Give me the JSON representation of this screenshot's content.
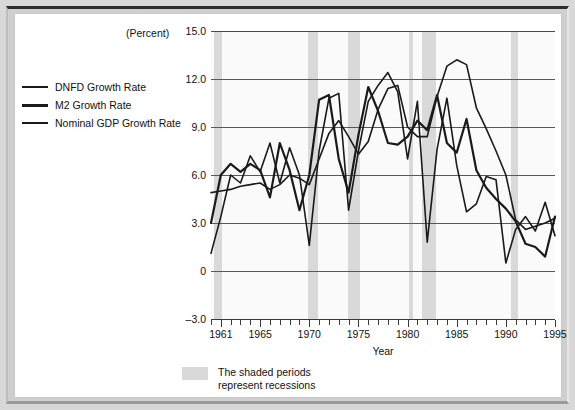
{
  "figure": {
    "unit_label": "(Percent)",
    "x_axis_title": "Year",
    "footnote": [
      "The shaded periods",
      "represent recessions"
    ],
    "shade_color": "#d9d9d9",
    "line_color": "#1a1a1a",
    "plot_bg": "#fafafa"
  },
  "legend": {
    "items": [
      {
        "label": "DNFD Growth Rate",
        "thick": false
      },
      {
        "label": "M2 Growth Rate",
        "thick": true
      },
      {
        "label": "Nominal GDP Growth Rate",
        "thick": false
      }
    ]
  },
  "chart_data": {
    "type": "line",
    "title": "",
    "xlabel": "Year",
    "ylabel": "(Percent)",
    "xlim": [
      1960,
      1995
    ],
    "ylim": [
      -3.0,
      15.0
    ],
    "grid": true,
    "legend_position": "left",
    "ytick_labels": [
      "15.0",
      "12.0",
      "9.0",
      "6.0",
      "3.0",
      "0",
      "-3.0"
    ],
    "ytick_values": [
      15.0,
      12.0,
      9.0,
      6.0,
      3.0,
      0,
      -3.0
    ],
    "xtick_labels": [
      "1961",
      "1965",
      "1970",
      "1975",
      "1980",
      "1985",
      "1990",
      "1995"
    ],
    "xtick_values": [
      1961,
      1965,
      1970,
      1975,
      1980,
      1985,
      1990,
      1995
    ],
    "x": [
      1960,
      1961,
      1962,
      1963,
      1964,
      1965,
      1966,
      1967,
      1968,
      1969,
      1970,
      1971,
      1972,
      1973,
      1974,
      1975,
      1976,
      1977,
      1978,
      1979,
      1980,
      1981,
      1982,
      1983,
      1984,
      1985,
      1986,
      1987,
      1988,
      1989,
      1990,
      1991,
      1992,
      1993,
      1994,
      1995
    ],
    "series": [
      {
        "name": "DNFD Growth Rate",
        "values": [
          4.9,
          5.0,
          5.1,
          5.3,
          5.4,
          5.5,
          5.1,
          5.4,
          6.0,
          5.8,
          5.4,
          7.0,
          8.6,
          9.4,
          8.4,
          7.3,
          8.1,
          10.1,
          11.4,
          11.6,
          9.0,
          8.4,
          8.4,
          10.9,
          12.8,
          13.2,
          12.9,
          10.2,
          8.9,
          7.5,
          6.0,
          3.2,
          2.6,
          2.8,
          3.0,
          3.3
        ]
      },
      {
        "name": "M2 Growth Rate",
        "values": [
          3.0,
          6.0,
          6.7,
          6.2,
          6.7,
          6.3,
          4.6,
          8.0,
          6.3,
          3.8,
          6.0,
          10.7,
          11.0,
          7.0,
          4.9,
          8.5,
          11.5,
          10.0,
          8.0,
          7.9,
          8.4,
          9.4,
          8.8,
          11.0,
          8.0,
          7.4,
          9.5,
          6.3,
          5.2,
          4.5,
          3.9,
          3.1,
          1.7,
          1.5,
          0.9,
          3.4
        ]
      },
      {
        "name": "Nominal GDP Growth Rate",
        "values": [
          1.1,
          3.4,
          6.0,
          5.5,
          7.2,
          6.2,
          8.0,
          5.5,
          7.7,
          6.0,
          1.6,
          7.5,
          10.8,
          11.1,
          3.8,
          7.5,
          10.6,
          11.6,
          12.4,
          11.2,
          7.0,
          10.6,
          1.8,
          7.6,
          10.8,
          6.6,
          3.7,
          4.2,
          5.9,
          5.7,
          0.5,
          2.6,
          3.4,
          2.5,
          4.3,
          2.2
        ]
      }
    ],
    "recessions": [
      {
        "start": 1960.3,
        "end": 1961.1
      },
      {
        "start": 1969.9,
        "end": 1970.9
      },
      {
        "start": 1973.9,
        "end": 1975.2
      },
      {
        "start": 1980.1,
        "end": 1980.6
      },
      {
        "start": 1981.5,
        "end": 1982.9
      },
      {
        "start": 1990.5,
        "end": 1991.2
      }
    ]
  }
}
